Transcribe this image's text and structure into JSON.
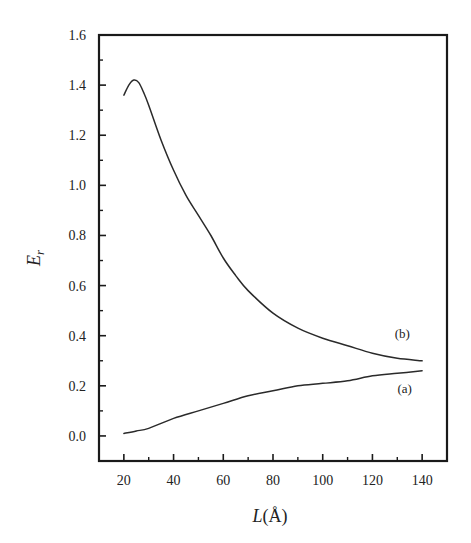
{
  "chart_data": {
    "type": "line",
    "title": "",
    "xlabel": "L(Å)",
    "xlabel_parts": {
      "var": "L",
      "unit": "(Å)"
    },
    "ylabel": "Er",
    "ylabel_parts": {
      "var": "E",
      "sub": "r"
    },
    "xlim": [
      10,
      150
    ],
    "ylim": [
      -0.1,
      1.6
    ],
    "xticks": [
      20,
      40,
      60,
      80,
      100,
      120,
      140
    ],
    "xtick_labels": [
      "20",
      "40",
      "60",
      "80",
      "100",
      "120",
      "140"
    ],
    "xminor": [
      30,
      50,
      70,
      90,
      110,
      130
    ],
    "yticks": [
      0.0,
      0.2,
      0.4,
      0.6,
      0.8,
      1.0,
      1.2,
      1.4,
      1.6
    ],
    "ytick_labels": [
      "0.0",
      "0.2",
      "0.4",
      "0.6",
      "0.8",
      "1.0",
      "1.2",
      "1.4",
      "1.6"
    ],
    "yminor": [
      0.1,
      0.3,
      0.5,
      0.7,
      0.9,
      1.1,
      1.3,
      1.5
    ],
    "grid": false,
    "legend": "inline labels near right end of curves",
    "series": [
      {
        "name": "(b)",
        "x": [
          20,
          22,
          24,
          26,
          28,
          30,
          35,
          40,
          45,
          50,
          55,
          60,
          65,
          70,
          80,
          90,
          100,
          110,
          120,
          130,
          140
        ],
        "values": [
          1.36,
          1.4,
          1.42,
          1.41,
          1.37,
          1.32,
          1.18,
          1.06,
          0.96,
          0.88,
          0.8,
          0.71,
          0.64,
          0.58,
          0.49,
          0.43,
          0.39,
          0.36,
          0.33,
          0.31,
          0.3
        ],
        "label_pos": {
          "x": 132,
          "y": 0.39
        }
      },
      {
        "name": "(a)",
        "x": [
          20,
          25,
          30,
          40,
          50,
          60,
          70,
          80,
          90,
          100,
          110,
          120,
          130,
          140
        ],
        "values": [
          0.01,
          0.02,
          0.03,
          0.07,
          0.1,
          0.13,
          0.16,
          0.18,
          0.2,
          0.21,
          0.22,
          0.24,
          0.25,
          0.26
        ],
        "label_pos": {
          "x": 133,
          "y": 0.17
        }
      }
    ]
  },
  "colors": {
    "axis": "#1a1a1a",
    "line": "#2a2a2a",
    "background": "#ffffff"
  }
}
